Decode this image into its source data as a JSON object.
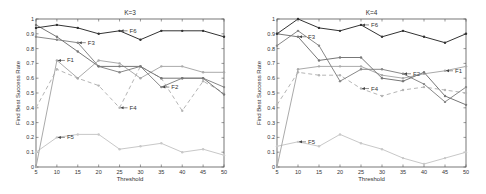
{
  "chart_data": [
    {
      "type": "line",
      "title": "K=3",
      "xlabel": "Threshold",
      "ylabel": "Find Best Success Rate",
      "x": [
        5,
        10,
        15,
        20,
        25,
        30,
        35,
        40,
        45,
        50
      ],
      "xticks": [
        "5",
        "10",
        "15",
        "20",
        "25",
        "30",
        "35",
        "40",
        "45",
        "50"
      ],
      "yticks": [
        "0",
        "0.1",
        "0.2",
        "0.3",
        "0.4",
        "0.5",
        "0.6",
        "0.7",
        "0.8",
        "0.9",
        "1"
      ],
      "ylim": [
        0,
        1
      ],
      "xlim": [
        5,
        50
      ],
      "grid": false,
      "series": [
        {
          "name": "F6",
          "values": [
            0.94,
            0.96,
            0.94,
            0.9,
            0.92,
            0.86,
            0.92,
            0.92,
            0.92,
            0.88
          ],
          "color": "#333333",
          "dash": "",
          "label_at": [
            25,
            0.92
          ]
        },
        {
          "name": "F3",
          "values": [
            0.96,
            0.88,
            0.78,
            0.68,
            0.68,
            0.68,
            0.6,
            0.6,
            0.6,
            0.49
          ],
          "color": "#777777",
          "dash": "",
          "label_at": [
            15,
            0.84
          ]
        },
        {
          "name": "F2",
          "values": [
            0.88,
            0.86,
            0.84,
            0.68,
            0.64,
            0.68,
            0.54,
            0.6,
            0.6,
            0.54
          ],
          "color": "#888888",
          "dash": "",
          "label_at": [
            35,
            0.54
          ]
        },
        {
          "name": "F1",
          "values": [
            0.0,
            0.72,
            0.6,
            0.72,
            0.7,
            0.6,
            0.68,
            0.68,
            0.64,
            0.64
          ],
          "color": "#aaaaaa",
          "dash": "",
          "label_at": [
            10,
            0.72
          ]
        },
        {
          "name": "F4",
          "values": [
            0.4,
            0.66,
            0.6,
            0.55,
            0.4,
            0.68,
            0.6,
            0.38,
            0.58,
            0.5
          ],
          "color": "#b5b5b5",
          "dash": "4,3",
          "label_at": [
            25,
            0.4
          ]
        },
        {
          "name": "F5",
          "values": [
            0.1,
            0.2,
            0.22,
            0.22,
            0.12,
            0.14,
            0.16,
            0.1,
            0.12,
            0.08
          ],
          "color": "#c8c8c8",
          "dash": "",
          "label_at": [
            10,
            0.2
          ]
        }
      ]
    },
    {
      "type": "line",
      "title": "K=4",
      "xlabel": "Threshold",
      "ylabel": "Find Best Success Rate",
      "x": [
        5,
        10,
        15,
        20,
        25,
        30,
        35,
        40,
        45,
        50
      ],
      "xticks": [
        "5",
        "10",
        "15",
        "20",
        "25",
        "30",
        "35",
        "40",
        "45",
        "50"
      ],
      "yticks": [
        "0",
        "0.1",
        "0.2",
        "0.3",
        "0.4",
        "0.5",
        "0.6",
        "0.7",
        "0.8",
        "0.9",
        "1"
      ],
      "ylim": [
        0,
        1
      ],
      "xlim": [
        5,
        50
      ],
      "grid": false,
      "series": [
        {
          "name": "F6",
          "values": [
            0.9,
            1.0,
            0.94,
            0.92,
            0.96,
            0.88,
            0.92,
            0.88,
            0.84,
            0.9
          ],
          "color": "#333333",
          "dash": "",
          "label_at": [
            25,
            0.96
          ]
        },
        {
          "name": "F3",
          "values": [
            0.9,
            0.88,
            0.72,
            0.74,
            0.74,
            0.6,
            0.58,
            0.64,
            0.48,
            0.42
          ],
          "color": "#777777",
          "dash": "",
          "label_at": [
            10,
            0.88
          ]
        },
        {
          "name": "F2",
          "values": [
            0.82,
            0.92,
            0.82,
            0.58,
            0.66,
            0.66,
            0.63,
            0.56,
            0.44,
            0.54
          ],
          "color": "#888888",
          "dash": "",
          "label_at": [
            35,
            0.63
          ]
        },
        {
          "name": "F1",
          "values": [
            0.0,
            0.66,
            0.68,
            0.68,
            0.68,
            0.62,
            0.6,
            0.63,
            0.65,
            0.68
          ],
          "color": "#aaaaaa",
          "dash": "",
          "label_at": [
            45,
            0.65
          ]
        },
        {
          "name": "F4",
          "values": [
            0.42,
            0.64,
            0.62,
            0.62,
            0.53,
            0.48,
            0.52,
            0.54,
            0.52,
            0.5
          ],
          "color": "#b5b5b5",
          "dash": "4,3",
          "label_at": [
            25,
            0.53
          ]
        },
        {
          "name": "F5",
          "values": [
            0.14,
            0.17,
            0.14,
            0.22,
            0.16,
            0.12,
            0.06,
            0.02,
            0.06,
            0.1
          ],
          "color": "#c8c8c8",
          "dash": "",
          "label_at": [
            10,
            0.17
          ]
        }
      ]
    }
  ],
  "panels": [
    {
      "box": {
        "x": 36,
        "y": 19,
        "w": 188,
        "h": 148
      }
    },
    {
      "box": {
        "x": 277,
        "y": 19,
        "w": 189,
        "h": 148
      }
    }
  ]
}
